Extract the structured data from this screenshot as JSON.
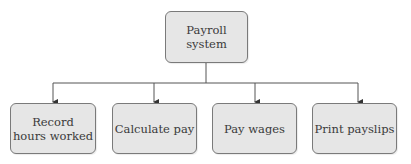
{
  "diagram": {
    "root": {
      "label": "Payroll\nsystem"
    },
    "children": [
      {
        "label": "Record\nhours worked"
      },
      {
        "label": "Calculate pay"
      },
      {
        "label": "Pay wages"
      },
      {
        "label": "Print payslips"
      }
    ],
    "colors": {
      "box_fill": "#e6e6e6",
      "box_border": "#7a7a7a",
      "line": "#555555",
      "text": "#3a3a3a"
    }
  }
}
